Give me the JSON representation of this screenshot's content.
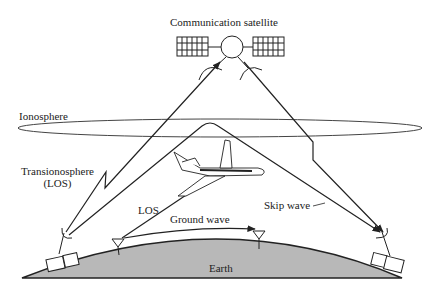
{
  "diagram": {
    "labels": {
      "satellite": "Communication satellite",
      "ionosphere": "Ionosphere",
      "transionosphere_line1": "Transionosphere",
      "transionosphere_line2": "(LOS)",
      "los": "LOS",
      "ground_wave": "Ground wave",
      "skip_wave": "Skip wave",
      "earth": "Earth"
    },
    "colors": {
      "stroke": "#222222",
      "earth_fill": "#b8b8b8",
      "background": "#ffffff"
    }
  }
}
